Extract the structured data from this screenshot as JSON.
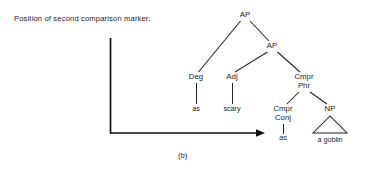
{
  "figure": {
    "prompt_label": "Position of second comparison marker:",
    "caption": "(b)",
    "axis": {
      "vertical_from": [
        110,
        38
      ],
      "vertical_to": [
        110,
        133
      ],
      "horizontal_from": [
        110,
        133
      ],
      "horizontal_to": [
        265,
        133
      ],
      "arrow_direction": "right"
    }
  },
  "tree": {
    "nodes": {
      "ap_top": {
        "label": "AP",
        "x": 245,
        "y": 17
      },
      "ap_second": {
        "label": "AP",
        "x": 272,
        "y": 48
      },
      "deg": {
        "label": "Deg",
        "x": 196,
        "y": 79
      },
      "adj": {
        "label": "Adj",
        "x": 232,
        "y": 79
      },
      "cmpr_phr_line1": {
        "label": "Cmpr",
        "x": 304,
        "y": 79
      },
      "cmpr_phr_line2": {
        "label": "Phr",
        "x": 304,
        "y": 88
      },
      "cmpr_conj_line1": {
        "label": "Cmpr",
        "x": 283,
        "y": 111
      },
      "cmpr_conj_line2": {
        "label": "Conj",
        "x": 283,
        "y": 120
      },
      "np": {
        "label": "NP",
        "x": 330,
        "y": 111
      }
    },
    "leaves": {
      "leaf_as_1": {
        "label": "as",
        "x": 196,
        "y": 111
      },
      "leaf_scary": {
        "label": "scary",
        "x": 232,
        "y": 111
      },
      "leaf_as_2": {
        "label": "as",
        "x": 283,
        "y": 140
      },
      "leaf_a_goblin": {
        "label": "a goblin",
        "x": 330,
        "y": 142
      }
    },
    "sentence": "as scary as a goblin",
    "colors": {
      "ink": "#1d1d1d",
      "line": "#232323",
      "axis": "#111111",
      "background": "#ffffff"
    }
  }
}
